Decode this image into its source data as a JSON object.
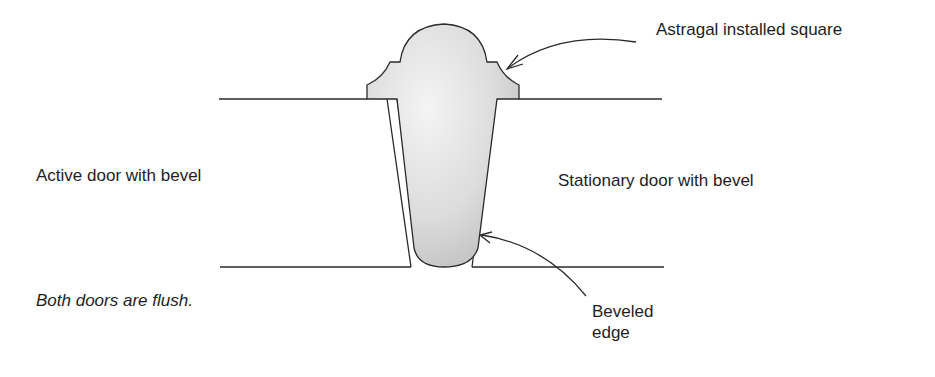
{
  "labels": {
    "astragal": "Astragal installed square",
    "active_door": "Active door with bevel",
    "stationary_door": "Stationary door with bevel",
    "caption": "Both doors are flush.",
    "beveled_edge_line1": "Beveled",
    "beveled_edge_line2": "edge"
  },
  "colors": {
    "line": "#2a2a2a",
    "astragal_fill": "#d4d4d4",
    "background": "#ffffff"
  }
}
